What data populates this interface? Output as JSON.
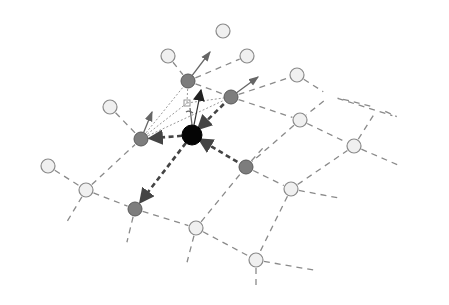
{
  "diagram": {
    "colors": {
      "background": "#ffffff",
      "center_node": "#050505",
      "neighbor_node": "#7d7d7d",
      "mesh_node": "#f0f0f0",
      "mesh_edge": "#8a8a8a",
      "force_edge": "#444444"
    },
    "center_node": {
      "id": "c",
      "x": 192,
      "y": 135,
      "r": 10
    },
    "neighbor_nodes": [
      {
        "id": "n1",
        "x": 188,
        "y": 81,
        "r": 7
      },
      {
        "id": "n2",
        "x": 231,
        "y": 97,
        "r": 7
      },
      {
        "id": "n3",
        "x": 141,
        "y": 139,
        "r": 7
      },
      {
        "id": "n4",
        "x": 246,
        "y": 167,
        "r": 7
      },
      {
        "id": "n5",
        "x": 135,
        "y": 209,
        "r": 7
      }
    ],
    "mesh_nodes": [
      {
        "id": "m1",
        "x": 168,
        "y": 56,
        "r": 7
      },
      {
        "id": "m2",
        "x": 223,
        "y": 31,
        "r": 7
      },
      {
        "id": "m3",
        "x": 247,
        "y": 56,
        "r": 7
      },
      {
        "id": "m4",
        "x": 297,
        "y": 75,
        "r": 7
      },
      {
        "id": "m5",
        "x": 110,
        "y": 107,
        "r": 7
      },
      {
        "id": "m6",
        "x": 300,
        "y": 120,
        "r": 7
      },
      {
        "id": "m7",
        "x": 354,
        "y": 146,
        "r": 7
      },
      {
        "id": "m8",
        "x": 48,
        "y": 166,
        "r": 7
      },
      {
        "id": "m9",
        "x": 86,
        "y": 190,
        "r": 7
      },
      {
        "id": "m10",
        "x": 291,
        "y": 189,
        "r": 7
      },
      {
        "id": "m11",
        "x": 196,
        "y": 228,
        "r": 7
      },
      {
        "id": "m12",
        "x": 256,
        "y": 260,
        "r": 7
      }
    ],
    "mesh_edges": [
      [
        168,
        56,
        188,
        81
      ],
      [
        188,
        81,
        247,
        56
      ],
      [
        231,
        97,
        297,
        75
      ],
      [
        297,
        75,
        330,
        96
      ],
      [
        330,
        96,
        400,
        118
      ],
      [
        330,
        96,
        300,
        120
      ],
      [
        231,
        97,
        300,
        120
      ],
      [
        300,
        120,
        354,
        146
      ],
      [
        354,
        146,
        378,
        108
      ],
      [
        378,
        108,
        330,
        96
      ],
      [
        378,
        108,
        404,
        120
      ],
      [
        354,
        146,
        405,
        168
      ],
      [
        300,
        120,
        246,
        167
      ],
      [
        246,
        167,
        291,
        189
      ],
      [
        291,
        189,
        354,
        146
      ],
      [
        291,
        189,
        350,
        200
      ],
      [
        291,
        189,
        256,
        260
      ],
      [
        256,
        260,
        325,
        272
      ],
      [
        256,
        260,
        256,
        295
      ],
      [
        196,
        228,
        256,
        260
      ],
      [
        196,
        228,
        246,
        167
      ],
      [
        196,
        228,
        185,
        270
      ],
      [
        135,
        209,
        196,
        228
      ],
      [
        135,
        209,
        125,
        250
      ],
      [
        86,
        190,
        135,
        209
      ],
      [
        86,
        190,
        62,
        230
      ],
      [
        48,
        166,
        86,
        190
      ],
      [
        86,
        190,
        141,
        139
      ],
      [
        110,
        107,
        141,
        139
      ],
      [
        188,
        81,
        231,
        97
      ],
      [
        246,
        167,
        270,
        140
      ]
    ],
    "force_edges": [
      {
        "from": [
          192,
          135
        ],
        "to": [
          141,
          139
        ]
      },
      {
        "from": [
          192,
          135
        ],
        "to": [
          135,
          209
        ]
      },
      {
        "from": [
          231,
          97
        ],
        "to": [
          192,
          135
        ]
      },
      {
        "from": [
          246,
          167
        ],
        "to": [
          192,
          135
        ]
      },
      {
        "from": [
          192,
          135
        ],
        "to": [
          188,
          81
        ],
        "style": "thin"
      }
    ],
    "vectors": [
      {
        "from": [
          188,
          81
        ],
        "to": [
          210,
          52
        ]
      },
      {
        "from": [
          231,
          97
        ],
        "to": [
          258,
          77
        ]
      },
      {
        "from": [
          141,
          139
        ],
        "to": [
          152,
          112
        ]
      },
      {
        "from": [
          192,
          135
        ],
        "to": [
          201,
          90
        ],
        "main": true
      }
    ],
    "marker": {
      "x": 187,
      "y": 103,
      "size": 6
    }
  }
}
